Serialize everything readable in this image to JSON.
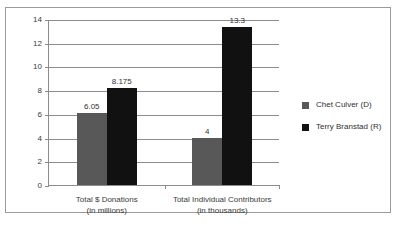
{
  "chart_data": {
    "type": "bar",
    "title": "",
    "xlabel": "",
    "ylabel": "",
    "ylim": [
      0,
      14
    ],
    "yticks": [
      0,
      2,
      4,
      6,
      8,
      10,
      12,
      14
    ],
    "ytick_labels": [
      "0",
      "2",
      "4",
      "6",
      "8",
      "10",
      "12",
      "14"
    ],
    "grid": true,
    "legend_position": "right",
    "categories": [
      "Total $ Donations\n(in millions)",
      "Total Individual Contributors\n(in thousands)"
    ],
    "category_lines": [
      [
        "Total $ Donations",
        "(in millions)"
      ],
      [
        "Total Individual Contributors",
        "(in thousands)"
      ]
    ],
    "series": [
      {
        "name": "Chet Culver (D)",
        "color": "#585858",
        "values": [
          6.05,
          4
        ],
        "value_labels": [
          "6.05",
          "4"
        ]
      },
      {
        "name": "Terry Branstad (R)",
        "color": "#111111",
        "values": [
          8.175,
          13.3
        ],
        "value_labels": [
          "8.175",
          "13.3"
        ]
      }
    ]
  },
  "frame": {
    "border_color": "#9a9a9a",
    "background": "#ffffff"
  }
}
